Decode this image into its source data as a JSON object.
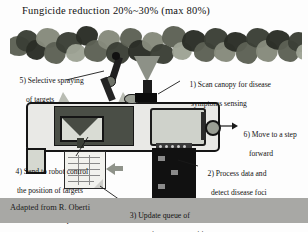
{
  "title": "Fungicide reduction 20%~30%  (max 80%)",
  "canopy": {
    "name": "vineyard-canopy-photo"
  },
  "callouts": [
    {
      "id": "5",
      "line1": "5) Selective spraying",
      "line2": "of targets"
    },
    {
      "id": "1",
      "line1": "1) Scan canopy for disease",
      "line2": "symptoms sensing"
    },
    {
      "id": "6",
      "line1": "6) Move to a step",
      "line2": "forward"
    },
    {
      "id": "2",
      "line1": "2) Process data and",
      "line2": "detect disease foci"
    },
    {
      "id": "4",
      "line1": "4) Send to robot control",
      "line2": "the position of targets",
      "line3": "in current workspace"
    },
    {
      "id": "3",
      "line1": "3) Update queue of",
      "line2": "spraying targets position"
    }
  ],
  "credit": "Adapted from R. Oberti",
  "colors": {
    "background": "#fdfdfd",
    "band": "#a8a8a5",
    "foliage_dark": "#3b3f36",
    "foliage_mid": "#5d6155",
    "foliage_light": "#868a7c",
    "machine_dark": "#111111",
    "machine_body": "#e9e9e6",
    "text": "#111111"
  }
}
